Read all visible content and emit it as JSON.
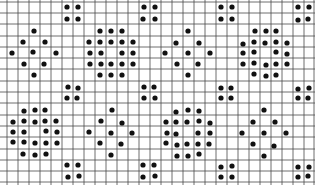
{
  "figure": {
    "width": 315,
    "height": 185,
    "background": "#ffffff",
    "grid": {
      "color": "#4a4a4a",
      "x_lines": [
        7,
        18,
        29,
        40,
        51,
        62,
        73,
        84,
        95,
        106,
        117,
        128,
        139,
        150,
        161,
        172,
        183,
        194,
        205,
        216,
        227,
        238,
        249,
        260,
        271,
        282,
        293,
        304,
        314
      ],
      "y_lines": [
        2,
        13,
        24,
        36,
        47,
        58,
        69,
        81,
        92,
        103,
        115,
        126,
        137,
        149,
        160,
        171,
        182
      ],
      "x_extent": [
        0,
        315
      ],
      "y_extent": [
        0,
        185
      ]
    },
    "dot_color": "#111111",
    "dot_radius": 2.6,
    "groups": [
      {
        "name": "pair-top-1",
        "dots": [
          [
            67,
            7
          ],
          [
            78,
            7
          ],
          [
            67,
            19
          ],
          [
            78,
            19
          ]
        ]
      },
      {
        "name": "pair-top-2",
        "dots": [
          [
            144,
            7
          ],
          [
            155,
            7
          ],
          [
            143,
            19
          ],
          [
            155,
            19
          ]
        ]
      },
      {
        "name": "pair-top-3",
        "dots": [
          [
            221,
            7
          ],
          [
            232,
            7
          ],
          [
            221,
            19
          ],
          [
            232,
            19
          ]
        ]
      },
      {
        "name": "pair-top-4",
        "dots": [
          [
            298,
            7
          ],
          [
            309,
            7
          ],
          [
            298,
            20
          ],
          [
            308,
            19
          ]
        ]
      },
      {
        "name": "ring-top-1",
        "dots": [
          [
            34,
            31
          ],
          [
            23,
            42
          ],
          [
            45,
            42
          ],
          [
            12,
            53
          ],
          [
            33,
            52
          ],
          [
            56,
            53
          ],
          [
            24,
            64
          ],
          [
            44,
            64
          ],
          [
            34,
            75
          ]
        ]
      },
      {
        "name": "cluster-top-2",
        "dots": [
          [
            100,
            31
          ],
          [
            111,
            31
          ],
          [
            122,
            31
          ],
          [
            89,
            42
          ],
          [
            100,
            42
          ],
          [
            111,
            42
          ],
          [
            122,
            42
          ],
          [
            133,
            42
          ],
          [
            90,
            53
          ],
          [
            101,
            53
          ],
          [
            122,
            53
          ],
          [
            133,
            53
          ],
          [
            90,
            64
          ],
          [
            101,
            64
          ],
          [
            111,
            64
          ],
          [
            122,
            64
          ],
          [
            133,
            64
          ],
          [
            100,
            75
          ],
          [
            111,
            75
          ],
          [
            122,
            75
          ]
        ]
      },
      {
        "name": "ring-top-3",
        "dots": [
          [
            188,
            31
          ],
          [
            176,
            43
          ],
          [
            199,
            43
          ],
          [
            165,
            53
          ],
          [
            188,
            53
          ],
          [
            210,
            53
          ],
          [
            177,
            64
          ],
          [
            198,
            64
          ],
          [
            188,
            75
          ]
        ]
      },
      {
        "name": "cluster-top-4",
        "dots": [
          [
            255,
            31
          ],
          [
            266,
            31
          ],
          [
            276,
            31
          ],
          [
            243,
            44
          ],
          [
            254,
            42
          ],
          [
            265,
            43
          ],
          [
            276,
            42
          ],
          [
            287,
            43
          ],
          [
            243,
            53
          ],
          [
            254,
            52
          ],
          [
            276,
            52
          ],
          [
            287,
            54
          ],
          [
            243,
            64
          ],
          [
            254,
            63
          ],
          [
            266,
            65
          ],
          [
            276,
            64
          ],
          [
            287,
            64
          ],
          [
            254,
            74
          ],
          [
            266,
            76
          ],
          [
            276,
            75
          ]
        ]
      },
      {
        "name": "pair-mid-1",
        "dots": [
          [
            68,
            87
          ],
          [
            78,
            88
          ],
          [
            67,
            98
          ],
          [
            77,
            98
          ]
        ]
      },
      {
        "name": "pair-mid-2",
        "dots": [
          [
            144,
            87
          ],
          [
            154,
            87
          ],
          [
            144,
            98
          ],
          [
            155,
            98
          ]
        ]
      },
      {
        "name": "pair-mid-3",
        "dots": [
          [
            221,
            88
          ],
          [
            231,
            88
          ],
          [
            221,
            98
          ],
          [
            231,
            98
          ]
        ]
      },
      {
        "name": "pair-mid-4",
        "dots": [
          [
            298,
            89
          ],
          [
            309,
            88
          ],
          [
            298,
            98
          ],
          [
            308,
            98
          ]
        ]
      },
      {
        "name": "cluster-bottom-1",
        "dots": [
          [
            24,
            111
          ],
          [
            35,
            110
          ],
          [
            45,
            110
          ],
          [
            13,
            122
          ],
          [
            24,
            121
          ],
          [
            35,
            122
          ],
          [
            45,
            121
          ],
          [
            56,
            121
          ],
          [
            13,
            132
          ],
          [
            24,
            132
          ],
          [
            46,
            131
          ],
          [
            57,
            132
          ],
          [
            13,
            142
          ],
          [
            24,
            142
          ],
          [
            35,
            143
          ],
          [
            46,
            143
          ],
          [
            57,
            143
          ],
          [
            23,
            154
          ],
          [
            35,
            155
          ],
          [
            46,
            154
          ]
        ]
      },
      {
        "name": "ring-bottom-2",
        "dots": [
          [
            112,
            110
          ],
          [
            101,
            121
          ],
          [
            122,
            123
          ],
          [
            89,
            132
          ],
          [
            111,
            133
          ],
          [
            132,
            133
          ],
          [
            100,
            143
          ],
          [
            121,
            144
          ],
          [
            111,
            155
          ]
        ]
      },
      {
        "name": "cluster-bottom-3",
        "dots": [
          [
            176,
            112
          ],
          [
            188,
            110
          ],
          [
            199,
            111
          ],
          [
            166,
            122
          ],
          [
            176,
            122
          ],
          [
            187,
            122
          ],
          [
            199,
            121
          ],
          [
            210,
            123
          ],
          [
            167,
            133
          ],
          [
            176,
            134
          ],
          [
            198,
            133
          ],
          [
            210,
            133
          ],
          [
            166,
            143
          ],
          [
            177,
            145
          ],
          [
            187,
            144
          ],
          [
            198,
            144
          ],
          [
            209,
            144
          ],
          [
            177,
            156
          ],
          [
            188,
            156
          ],
          [
            199,
            154
          ]
        ]
      },
      {
        "name": "ring-bottom-4",
        "dots": [
          [
            264,
            110
          ],
          [
            253,
            122
          ],
          [
            275,
            122
          ],
          [
            242,
            133
          ],
          [
            264,
            133
          ],
          [
            286,
            133
          ],
          [
            253,
            144
          ],
          [
            274,
            146
          ],
          [
            264,
            156
          ]
        ]
      },
      {
        "name": "pair-bottom-1",
        "dots": [
          [
            67,
            165
          ],
          [
            78,
            165
          ],
          [
            68,
            177
          ],
          [
            79,
            176
          ]
        ]
      },
      {
        "name": "pair-bottom-2",
        "dots": [
          [
            143,
            165
          ],
          [
            154,
            165
          ],
          [
            143,
            177
          ],
          [
            155,
            176
          ]
        ]
      },
      {
        "name": "pair-bottom-3",
        "dots": [
          [
            221,
            167
          ],
          [
            232,
            166
          ],
          [
            221,
            177
          ],
          [
            232,
            177
          ]
        ]
      },
      {
        "name": "pair-bottom-4",
        "dots": [
          [
            298,
            167
          ],
          [
            309,
            167
          ],
          [
            298,
            177
          ],
          [
            308,
            176
          ]
        ]
      }
    ]
  }
}
